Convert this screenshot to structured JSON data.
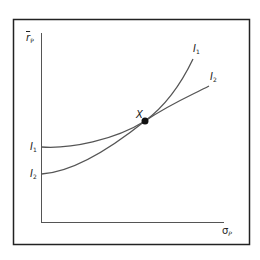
{
  "diagram": {
    "type": "indifference-curves",
    "y_axis": {
      "label": "r",
      "overbar": true,
      "subscript": "P"
    },
    "x_axis": {
      "label": "σ",
      "subscript": "P"
    },
    "curves": [
      {
        "name": "I",
        "subscript": "1",
        "left_label": "I",
        "left_subscript": "1"
      },
      {
        "name": "I",
        "subscript": "2",
        "left_label": "I",
        "left_subscript": "2"
      }
    ],
    "point": {
      "label": "X"
    },
    "colors": {
      "line": "#555555",
      "frame": "#222222",
      "point": "#111111"
    }
  }
}
